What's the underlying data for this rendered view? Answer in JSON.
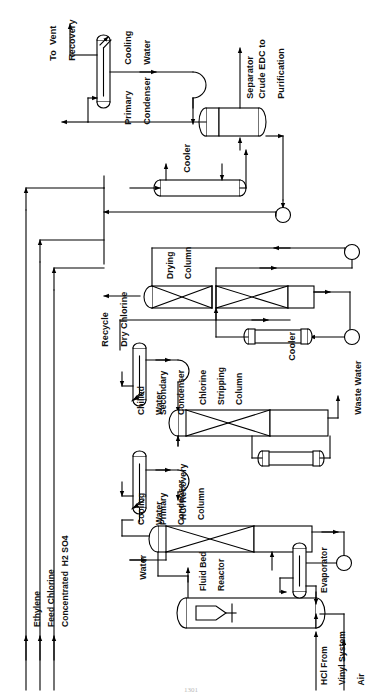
{
  "figure": {
    "kind": "process-flow-diagram",
    "orientation": "rotated-90-ccw",
    "page_number": "1301",
    "line_color": "#000000",
    "background_color": "#ffffff"
  },
  "equipment": [
    {
      "id": "primary-condenser-top",
      "label": "Primary\nCondenser",
      "type": "vertical-condenser"
    },
    {
      "id": "separator",
      "label": "Separator",
      "type": "horizontal-drum"
    },
    {
      "id": "cooler-1",
      "label": "Cooler",
      "type": "shell-and-tube-exchanger"
    },
    {
      "id": "drying-column",
      "label": "Drying\nColumn",
      "type": "packed-column"
    },
    {
      "id": "cooler-2",
      "label": "Cooler",
      "type": "shell-and-tube-exchanger"
    },
    {
      "id": "secondary-condenser",
      "label": "Secondary\nCondenser",
      "type": "vertical-condenser"
    },
    {
      "id": "chlorine-stripping-column",
      "label": "Chlorine\nStripping\nColumn",
      "type": "packed-column"
    },
    {
      "id": "primary-condenser-lower",
      "label": "Primary\nCondenser",
      "type": "vertical-condenser"
    },
    {
      "id": "hcl-recovery-column",
      "label": "HCl Recovery\nColumn",
      "type": "packed-column"
    },
    {
      "id": "fluid-bed-reactor",
      "label": "Fluid Bed\nReactor",
      "type": "fluid-bed-reactor"
    },
    {
      "id": "evaporator",
      "label": "Evaporator",
      "type": "vertical-evaporator"
    }
  ],
  "streams": [
    {
      "id": "to-vent-recovery",
      "label": "To  Vent\nRecovery",
      "direction": "out"
    },
    {
      "id": "cooling-water-top",
      "label": "Cooling\nWater",
      "direction": "utility"
    },
    {
      "id": "crude-edc",
      "label": "Crude EDC to\nPurification",
      "direction": "out"
    },
    {
      "id": "recycle-dry-chlorine",
      "label": "Recycle\nDry Chlorine",
      "direction": "recycle"
    },
    {
      "id": "chilled-water",
      "label": "Chilled\nWater",
      "direction": "utility"
    },
    {
      "id": "cooling-water-lower",
      "label": "Cooling\nWater",
      "direction": "utility"
    },
    {
      "id": "waste-water",
      "label": "Waste Water",
      "direction": "out"
    },
    {
      "id": "water-feed",
      "label": "Water",
      "direction": "in"
    },
    {
      "id": "ethylene",
      "label": "Ethylene",
      "direction": "in"
    },
    {
      "id": "feed-chlorine",
      "label": "Feed Chlorine",
      "direction": "in"
    },
    {
      "id": "sulfuric-acid",
      "label": "Concentrated  H2 SO4",
      "direction": "in"
    },
    {
      "id": "hcl-from-vinyl",
      "label": "HCl From\nVinyl System",
      "direction": "in"
    },
    {
      "id": "air",
      "label": "Air",
      "direction": "in"
    }
  ],
  "labels": {
    "to_vent_recovery_l1": "To  Vent",
    "to_vent_recovery_l2": "Recovery",
    "cooling_water_top_l1": "Cooling",
    "cooling_water_top_l2": "Water",
    "primary_condenser_top_l1": "Primary",
    "primary_condenser_top_l2": "Condenser",
    "separator": "Separator",
    "crude_edc_l1": "Crude EDC to",
    "crude_edc_l2": "Purification",
    "cooler_1": "Cooler",
    "drying_column_l1": "Drying",
    "drying_column_l2": "Column",
    "recycle_dry_chlorine_l1": "Recycle",
    "recycle_dry_chlorine_l2": "Dry Chlorine",
    "cooler_2": "Cooler",
    "chilled_water_l1": "Chilled",
    "chilled_water_l2": "Water",
    "secondary_condenser_l1": "Secondary",
    "secondary_condenser_l2": "Condenser",
    "chlorine_stripping_l1": "Chlorine",
    "chlorine_stripping_l2": "Stripping",
    "chlorine_stripping_l3": "Column",
    "waste_water": "Waste Water",
    "cooling_water_lower_l1": "Cooling",
    "cooling_water_lower_l2": "Water",
    "primary_condenser_lower_l1": "Primary",
    "primary_condenser_lower_l2": "Condenser",
    "hcl_recovery_l1": "HCl Recovery",
    "hcl_recovery_l2": "Column",
    "water_feed": "Water",
    "fluid_bed_reactor_l1": "Fluid Bed",
    "fluid_bed_reactor_l2": "Reactor",
    "evaporator": "Evaporator",
    "hcl_from_vinyl_l1": "HCl From",
    "hcl_from_vinyl_l2": "Vinyl System",
    "air": "Air",
    "ethylene": "Ethylene",
    "feed_chlorine": "Feed Chlorine",
    "sulfuric_acid": "Concentrated  H2 SO4",
    "page_number": "1301"
  }
}
